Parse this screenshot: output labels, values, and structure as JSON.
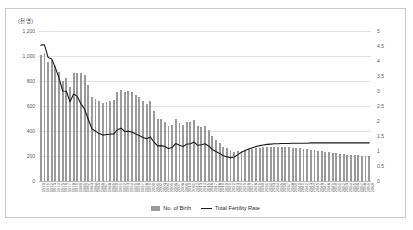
{
  "chart_data": {
    "type": "bar",
    "title": "",
    "unit_label": "(천 명)",
    "xlabel": "",
    "ylabel": "",
    "grid": true,
    "legend_position": "bottom",
    "left_axis": {
      "name": "No. of Birth",
      "unit": "thousand persons",
      "ylim": [
        0,
        1200
      ],
      "ticks": [
        0,
        200,
        400,
        600,
        800,
        1000,
        1200
      ],
      "tick_labels": [
        "0",
        "200",
        "400",
        "600",
        "800",
        "1,000",
        "1,200"
      ]
    },
    "right_axis": {
      "name": "Total Fertility Rate",
      "ylim": [
        0,
        5
      ],
      "ticks": [
        0,
        0.5,
        1,
        1.5,
        2,
        2.5,
        3,
        3.5,
        4,
        4.5,
        5
      ],
      "tick_labels": [
        "0",
        "0.5",
        "1",
        "1.5",
        "2",
        "2.5",
        "3",
        "3.5",
        "4",
        "4.5",
        "5"
      ]
    },
    "categories": [
      "1970",
      "1971",
      "1972",
      "1973",
      "1974",
      "1975",
      "1976",
      "1977",
      "1978",
      "1979",
      "1980",
      "1981",
      "1982",
      "1983",
      "1984",
      "1985",
      "1986",
      "1987",
      "1988",
      "1989",
      "1990",
      "1991",
      "1992",
      "1993",
      "1994",
      "1995",
      "1996",
      "1997",
      "1998",
      "1999",
      "2000",
      "2001",
      "2002",
      "2003",
      "2004",
      "2005",
      "2006",
      "2007",
      "2008",
      "2009",
      "2010",
      "2011",
      "2012",
      "2013",
      "2014",
      "2015",
      "2016",
      "2017",
      "2018",
      "2019",
      "2020",
      "2021",
      "2022",
      "2023",
      "2024",
      "2025",
      "2026",
      "2027",
      "2028",
      "2029",
      "2030",
      "2031",
      "2032",
      "2033",
      "2034",
      "2035",
      "2036",
      "2037",
      "2038",
      "2039",
      "2040",
      "2041",
      "2042",
      "2043",
      "2044",
      "2045",
      "2046",
      "2047",
      "2048",
      "2049",
      "2050",
      "2051",
      "2052",
      "2053",
      "2054",
      "2055",
      "2056",
      "2057",
      "2058",
      "2059",
      "2060"
    ],
    "series": [
      {
        "name": "No. of Birth",
        "axis": "left",
        "type": "bar",
        "color": "#9a9a9a",
        "values": [
          1007,
          1025,
          953,
          966,
          923,
          874,
          797,
          826,
          751,
          865,
          865,
          867,
          849,
          769,
          675,
          656,
          637,
          624,
          634,
          640,
          650,
          710,
          731,
          716,
          722,
          715,
          691,
          675,
          642,
          620,
          640,
          557,
          497,
          495,
          476,
          438,
          451,
          497,
          466,
          445,
          470,
          471,
          485,
          437,
          435,
          438,
          406,
          357,
          327,
          303,
          275,
          261,
          249,
          230,
          238,
          243,
          248,
          253,
          258,
          263,
          267,
          270,
          272,
          273,
          274,
          274,
          273,
          272,
          270,
          268,
          266,
          263,
          259,
          255,
          251,
          246,
          242,
          237,
          233,
          229,
          225,
          221,
          218,
          215,
          212,
          210,
          208,
          206,
          204,
          203,
          202
        ]
      },
      {
        "name": "Total Fertility Rate",
        "axis": "right",
        "type": "line",
        "color": "#1a1a1a",
        "values": [
          4.53,
          4.54,
          4.12,
          4.07,
          3.77,
          3.43,
          3.0,
          2.99,
          2.64,
          2.9,
          2.82,
          2.57,
          2.39,
          2.06,
          1.74,
          1.66,
          1.58,
          1.53,
          1.55,
          1.56,
          1.57,
          1.71,
          1.76,
          1.65,
          1.66,
          1.63,
          1.57,
          1.52,
          1.45,
          1.41,
          1.47,
          1.3,
          1.17,
          1.18,
          1.15,
          1.08,
          1.12,
          1.25,
          1.19,
          1.15,
          1.23,
          1.24,
          1.3,
          1.19,
          1.21,
          1.24,
          1.17,
          1.05,
          0.98,
          0.92,
          0.84,
          0.81,
          0.78,
          0.8,
          0.88,
          0.96,
          1.02,
          1.07,
          1.11,
          1.15,
          1.18,
          1.2,
          1.22,
          1.23,
          1.24,
          1.24,
          1.25,
          1.25,
          1.25,
          1.26,
          1.26,
          1.26,
          1.26,
          1.26,
          1.27,
          1.27,
          1.27,
          1.27,
          1.27,
          1.27,
          1.27,
          1.27,
          1.27,
          1.27,
          1.27,
          1.27,
          1.27,
          1.27,
          1.27,
          1.27,
          1.27
        ]
      }
    ],
    "legend": [
      {
        "label": "No. of Birth",
        "marker": "bar",
        "color": "#9a9a9a"
      },
      {
        "label": "Total Fertility Rate",
        "marker": "line",
        "color": "#1a1a1a"
      }
    ]
  }
}
